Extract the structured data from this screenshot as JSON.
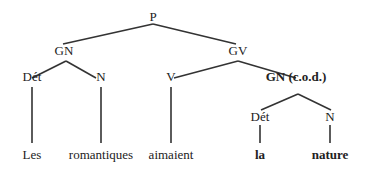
{
  "tree": {
    "nodes": [
      {
        "id": "P",
        "label": "P",
        "x": 153,
        "y": 10,
        "bold": false
      },
      {
        "id": "GN",
        "label": "GN",
        "x": 64,
        "y": 44,
        "bold": false
      },
      {
        "id": "GV",
        "label": "GV",
        "x": 238,
        "y": 44,
        "bold": false
      },
      {
        "id": "Det1",
        "label": "Dét",
        "x": 32,
        "y": 70,
        "bold": false
      },
      {
        "id": "N1",
        "label": "N",
        "x": 101,
        "y": 70,
        "bold": false
      },
      {
        "id": "V",
        "label": "V",
        "x": 171,
        "y": 70,
        "bold": false
      },
      {
        "id": "GNcod",
        "label": "GN (c.o.d.)",
        "x": 296,
        "y": 70,
        "bold": true
      },
      {
        "id": "Det2",
        "label": "Dét",
        "x": 260,
        "y": 110,
        "bold": false
      },
      {
        "id": "N2",
        "label": "N",
        "x": 330,
        "y": 110,
        "bold": false
      },
      {
        "id": "Les",
        "label": "Les",
        "x": 32,
        "y": 148,
        "bold": false
      },
      {
        "id": "romantiques",
        "label": "romantiques",
        "x": 101,
        "y": 148,
        "bold": false
      },
      {
        "id": "aimaient",
        "label": "aimaient",
        "x": 171,
        "y": 148,
        "bold": false
      },
      {
        "id": "la",
        "label": "la",
        "x": 260,
        "y": 148,
        "bold": true
      },
      {
        "id": "nature",
        "label": "nature",
        "x": 330,
        "y": 148,
        "bold": true
      }
    ],
    "edges": [
      [
        153,
        24,
        63,
        44
      ],
      [
        153,
        24,
        236,
        44
      ],
      [
        66,
        61,
        32,
        78
      ],
      [
        66,
        61,
        96,
        78
      ],
      [
        238,
        61,
        174,
        78
      ],
      [
        238,
        61,
        296,
        78
      ],
      [
        32,
        87,
        32,
        143
      ],
      [
        101,
        87,
        101,
        143
      ],
      [
        171,
        87,
        171,
        143
      ],
      [
        298,
        94,
        261,
        110
      ],
      [
        298,
        94,
        331,
        110
      ],
      [
        260,
        125,
        260,
        143
      ],
      [
        330,
        125,
        330,
        143
      ]
    ],
    "line_color": "#333333"
  }
}
